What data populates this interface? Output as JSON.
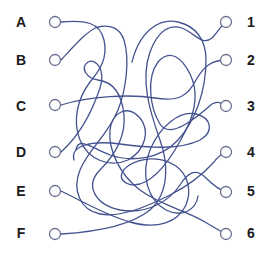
{
  "puzzle": {
    "type": "tangled-lines",
    "line_color": "#44528f",
    "node_stroke": "#6a7090",
    "left_labels": [
      "A",
      "B",
      "C",
      "D",
      "E",
      "F"
    ],
    "right_labels": [
      "1",
      "2",
      "3",
      "4",
      "5",
      "6"
    ]
  }
}
